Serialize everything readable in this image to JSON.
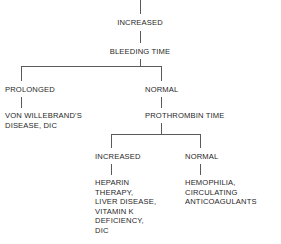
{
  "diagram": {
    "line_color": "#5a5a5a",
    "text_color": "#1f1f1f",
    "background": "#ffffff",
    "nodes": {
      "root": "INCREASED",
      "bleeding_time": "BLEEDING TIME",
      "branch1_left_label": "PROLONGED",
      "branch1_right_label": "NORMAL",
      "von_willebrand": "VON WILLEBRAND'S\nDISEASE, DIC",
      "prothrombin_time": "PROTHROMBIN TIME",
      "branch2_left_label": "INCREASED",
      "branch2_right_label": "NORMAL",
      "heparin_group": "HEPARIN\nTHERAPY,\nLIVER DISEASE,\nVITAMIN K\nDEFICIENCY,\nDIC",
      "hemophilia_group": "HEMOPHILIA,\nCIRCULATING\nANTICOAGULANTS"
    }
  }
}
